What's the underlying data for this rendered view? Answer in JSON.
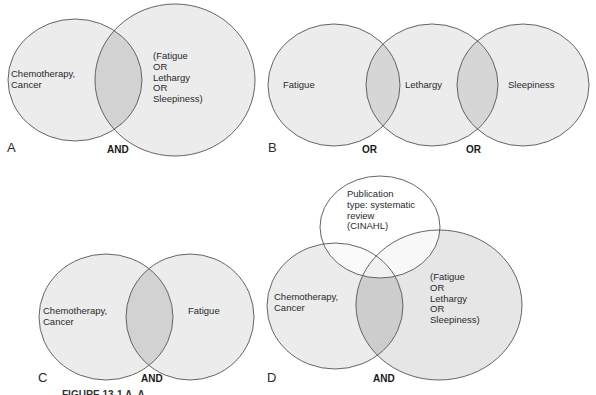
{
  "colors": {
    "circle_fill": "#ececec",
    "overlap_fill": "#d2d2d2",
    "top_overlap_fill": "#f4f4f4",
    "outline": "#555555",
    "background": "#ffffff"
  },
  "panels": [
    {
      "letter": "A",
      "operator": "AND",
      "sets": [
        {
          "label": "Chemotherapy,\nCancer"
        },
        {
          "label": "(Fatigue\nOR\nLethargy\nOR\nSleepiness)"
        }
      ]
    },
    {
      "letter": "B",
      "operators": [
        "OR",
        "OR"
      ],
      "sets": [
        {
          "label": "Fatigue"
        },
        {
          "label": "Lethargy"
        },
        {
          "label": "Sleepiness"
        }
      ]
    },
    {
      "letter": "C",
      "operator": "AND",
      "sets": [
        {
          "label": "Chemotherapy,\nCancer"
        },
        {
          "label": "Fatigue"
        }
      ]
    },
    {
      "letter": "D",
      "operator": "AND",
      "sets": [
        {
          "label": "Publication\ntype: systematic\nreview\n(CINAHL)"
        },
        {
          "label": "Chemotherapy,\nCancer"
        },
        {
          "label": "(Fatigue\nOR\nLethargy\nOR\nSleepiness)"
        }
      ]
    }
  ],
  "caption": "FIGURE 13-1 A, A..."
}
